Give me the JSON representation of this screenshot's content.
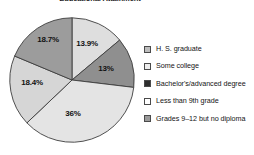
{
  "chart_data": {
    "type": "pie",
    "title": "Educational Attainment",
    "xlabel": "",
    "ylabel": "",
    "legend_position": "right",
    "grid": false,
    "categories": [
      "H. S. graduate",
      "Some college",
      "Bachelor's/advanced degree",
      "Less than 9th grade",
      "Grades 9–12 but no diploma"
    ],
    "values": [
      36,
      18.4,
      18.7,
      13.9,
      13
    ],
    "labels": [
      "36%",
      "18.4%",
      "18.7%",
      "13.9%",
      "13%"
    ],
    "colors": [
      "#e2e2e2",
      "#d2d2d2",
      "#9a9a9a",
      "#dcdcdc",
      "#8f8f8f"
    ],
    "slices": [
      {
        "label": "13.9%",
        "value": 13.9,
        "category": "Less than 9th grade",
        "color": "#dedede",
        "start_angle": 0,
        "end_angle": 50.04,
        "label_x": 87,
        "label_y": 43
      },
      {
        "label": "13%",
        "value": 13,
        "category": "Grades 9–12 but no diploma",
        "color": "#8f8f8f",
        "start_angle": 50.04,
        "end_angle": 96.84,
        "label_x": 106,
        "label_y": 68
      },
      {
        "label": "36%",
        "value": 36,
        "category": "H. S. graduate",
        "color": "#e4e4e4",
        "start_angle": 96.84,
        "end_angle": 226.44,
        "label_x": 73,
        "label_y": 113
      },
      {
        "label": "18.4%",
        "value": 18.4,
        "category": "Some college",
        "color": "#d6d6d6",
        "start_angle": 226.44,
        "end_angle": 292.68,
        "label_x": 32,
        "label_y": 82
      },
      {
        "label": "18.7%",
        "value": 18.7,
        "category": "Bachelor's/advanced degree",
        "color": "#9c9c9c",
        "start_angle": 292.68,
        "end_angle": 360,
        "label_x": 48,
        "label_y": 39
      }
    ]
  },
  "chart": {
    "title": "Educational Attainment"
  },
  "legend": {
    "items": [
      {
        "label": "H. S. graduate",
        "swatch": "#bdbdbd"
      },
      {
        "label": "Some college",
        "swatch": "#ededed"
      },
      {
        "label": "Bachelor's/advanced degree",
        "swatch": "#2e2e2e"
      },
      {
        "label": "Less than 9th grade",
        "swatch": "#ffffff"
      },
      {
        "label": "Grades 9–12 but no diploma",
        "swatch": "#9a9a9a"
      }
    ]
  }
}
